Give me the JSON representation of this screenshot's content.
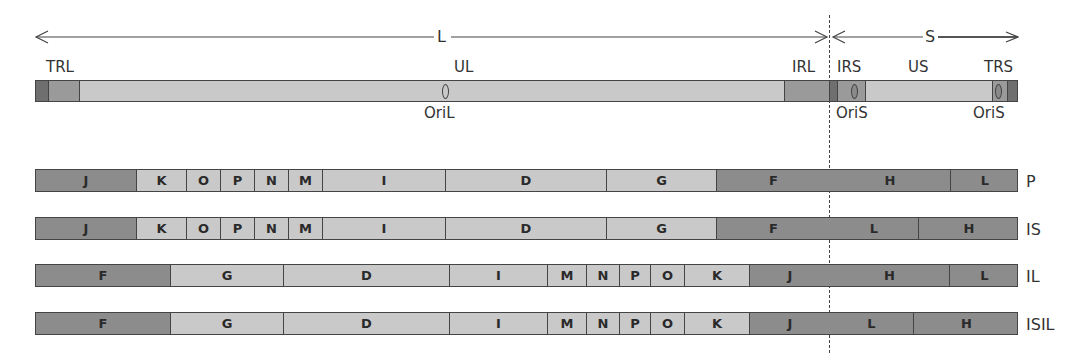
{
  "header": {
    "L_label": "L",
    "S_label": "S"
  },
  "genome": {
    "labels_above": {
      "TRL": "TRL",
      "UL": "UL",
      "IRL": "IRL",
      "IRS": "IRS",
      "US": "US",
      "TRS": "TRS"
    },
    "labels_below": {
      "OriL": "OriL",
      "OriS1": "OriS",
      "OriS2": "OriS"
    },
    "segments": [
      {
        "name": "terminal-dark-left",
        "x": 0,
        "w": 13,
        "tone": "vdark"
      },
      {
        "name": "TRL",
        "x": 13,
        "w": 31,
        "tone": "mid"
      },
      {
        "name": "UL",
        "x": 44,
        "w": 705,
        "tone": "light"
      },
      {
        "name": "IRL",
        "x": 749,
        "w": 45,
        "tone": "mid"
      },
      {
        "name": "junction-dark",
        "x": 794,
        "w": 8,
        "tone": "vdark"
      },
      {
        "name": "IRS",
        "x": 802,
        "w": 28,
        "tone": "mid"
      },
      {
        "name": "US",
        "x": 830,
        "w": 127,
        "tone": "light"
      },
      {
        "name": "TRS",
        "x": 957,
        "w": 15,
        "tone": "mid"
      },
      {
        "name": "terminal-dark-right",
        "x": 972,
        "w": 11,
        "tone": "vdark"
      }
    ]
  },
  "isomers": [
    {
      "label": "P",
      "segments": [
        {
          "t": "J",
          "x": 0,
          "w": 101,
          "tone": "dark"
        },
        {
          "t": "K",
          "x": 101,
          "w": 50,
          "tone": "light"
        },
        {
          "t": "O",
          "x": 151,
          "w": 34,
          "tone": "light"
        },
        {
          "t": "P",
          "x": 185,
          "w": 34,
          "tone": "light"
        },
        {
          "t": "N",
          "x": 219,
          "w": 34,
          "tone": "light"
        },
        {
          "t": "M",
          "x": 253,
          "w": 34,
          "tone": "light"
        },
        {
          "t": "I",
          "x": 287,
          "w": 123,
          "tone": "light"
        },
        {
          "t": "D",
          "x": 410,
          "w": 161,
          "tone": "light"
        },
        {
          "t": "G",
          "x": 571,
          "w": 110,
          "tone": "light"
        },
        {
          "t": "F",
          "x": 681,
          "w": 113,
          "tone": "dark",
          "noborder": true
        },
        {
          "t": "H",
          "x": 794,
          "w": 121,
          "tone": "dark"
        },
        {
          "t": "L",
          "x": 915,
          "w": 68,
          "tone": "dark"
        }
      ]
    },
    {
      "label": "IS",
      "segments": [
        {
          "t": "J",
          "x": 0,
          "w": 101,
          "tone": "dark"
        },
        {
          "t": "K",
          "x": 101,
          "w": 50,
          "tone": "light"
        },
        {
          "t": "O",
          "x": 151,
          "w": 34,
          "tone": "light"
        },
        {
          "t": "P",
          "x": 185,
          "w": 34,
          "tone": "light"
        },
        {
          "t": "N",
          "x": 219,
          "w": 34,
          "tone": "light"
        },
        {
          "t": "M",
          "x": 253,
          "w": 34,
          "tone": "light"
        },
        {
          "t": "I",
          "x": 287,
          "w": 123,
          "tone": "light"
        },
        {
          "t": "D",
          "x": 410,
          "w": 161,
          "tone": "light"
        },
        {
          "t": "G",
          "x": 571,
          "w": 110,
          "tone": "light"
        },
        {
          "t": "F",
          "x": 681,
          "w": 113,
          "tone": "dark",
          "noborder": true
        },
        {
          "t": "L",
          "x": 794,
          "w": 89,
          "tone": "dark"
        },
        {
          "t": "H",
          "x": 883,
          "w": 100,
          "tone": "dark"
        }
      ]
    },
    {
      "label": "IL",
      "segments": [
        {
          "t": "F",
          "x": 0,
          "w": 135,
          "tone": "dark"
        },
        {
          "t": "G",
          "x": 135,
          "w": 113,
          "tone": "light"
        },
        {
          "t": "D",
          "x": 248,
          "w": 166,
          "tone": "light"
        },
        {
          "t": "I",
          "x": 414,
          "w": 98,
          "tone": "light"
        },
        {
          "t": "M",
          "x": 512,
          "w": 39,
          "tone": "light"
        },
        {
          "t": "N",
          "x": 551,
          "w": 33,
          "tone": "light"
        },
        {
          "t": "P",
          "x": 584,
          "w": 31,
          "tone": "light"
        },
        {
          "t": "O",
          "x": 615,
          "w": 34,
          "tone": "light"
        },
        {
          "t": "K",
          "x": 649,
          "w": 65,
          "tone": "light"
        },
        {
          "t": "J",
          "x": 714,
          "w": 80,
          "tone": "dark",
          "noborder": true
        },
        {
          "t": "H",
          "x": 794,
          "w": 120,
          "tone": "dark"
        },
        {
          "t": "L",
          "x": 914,
          "w": 69,
          "tone": "dark"
        }
      ]
    },
    {
      "label": "ISIL",
      "segments": [
        {
          "t": "F",
          "x": 0,
          "w": 135,
          "tone": "dark"
        },
        {
          "t": "G",
          "x": 135,
          "w": 113,
          "tone": "light"
        },
        {
          "t": "D",
          "x": 248,
          "w": 166,
          "tone": "light"
        },
        {
          "t": "I",
          "x": 414,
          "w": 98,
          "tone": "light"
        },
        {
          "t": "M",
          "x": 512,
          "w": 39,
          "tone": "light"
        },
        {
          "t": "N",
          "x": 551,
          "w": 33,
          "tone": "light"
        },
        {
          "t": "P",
          "x": 584,
          "w": 31,
          "tone": "light"
        },
        {
          "t": "O",
          "x": 615,
          "w": 34,
          "tone": "light"
        },
        {
          "t": "K",
          "x": 649,
          "w": 65,
          "tone": "light"
        },
        {
          "t": "J",
          "x": 714,
          "w": 80,
          "tone": "dark",
          "noborder": true
        },
        {
          "t": "L",
          "x": 794,
          "w": 84,
          "tone": "dark"
        },
        {
          "t": "H",
          "x": 878,
          "w": 105,
          "tone": "dark"
        }
      ]
    }
  ],
  "colors": {
    "vdark": "#6f6f6f",
    "dark": "#8c8c8c",
    "mid": "#9a9a9a",
    "light": "#c9c9c9",
    "line": "#444444"
  }
}
